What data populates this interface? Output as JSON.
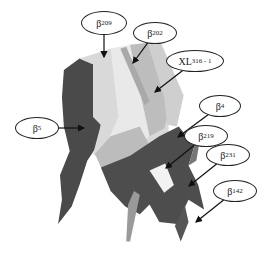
{
  "diagram": {
    "type": "3d-structure-annotated",
    "labels": [
      {
        "id": "b209",
        "base": "β",
        "sub": "209",
        "cx": 104,
        "cy": 23,
        "w": 44,
        "h": 22,
        "ax": 104,
        "ay": 57
      },
      {
        "id": "b202",
        "base": "β",
        "sub": "202",
        "cx": 155,
        "cy": 33,
        "w": 42,
        "h": 20,
        "ax": 133,
        "ay": 63
      },
      {
        "id": "xl316",
        "base": "XL",
        "sub": "316 - 1",
        "cx": 195,
        "cy": 61,
        "w": 56,
        "h": 20,
        "ax": 155,
        "ay": 92
      },
      {
        "id": "b4",
        "base": "β",
        "sub": "4",
        "cx": 220,
        "cy": 106,
        "w": 40,
        "h": 20,
        "ax": 178,
        "ay": 137
      },
      {
        "id": "b5",
        "base": "β",
        "sub": "5",
        "cx": 37,
        "cy": 128,
        "w": 42,
        "h": 20,
        "ax": 84,
        "ay": 128
      },
      {
        "id": "b219",
        "base": "β",
        "sub": "219",
        "cx": 206,
        "cy": 136,
        "w": 42,
        "h": 20,
        "ax": 166,
        "ay": 168
      },
      {
        "id": "b231",
        "base": "β",
        "sub": "231",
        "cx": 228,
        "cy": 155,
        "w": 42,
        "h": 20,
        "ax": 189,
        "ay": 186
      },
      {
        "id": "b142",
        "base": "β",
        "sub": "142",
        "cx": 235,
        "cy": 191,
        "w": 42,
        "h": 20,
        "ax": 196,
        "ay": 222
      }
    ],
    "colors": {
      "dark": "#4a4a4a",
      "mid": "#9a9a9a",
      "light": "#d4d4d4",
      "lighter": "#e8e8e8",
      "line": "#111111"
    }
  }
}
